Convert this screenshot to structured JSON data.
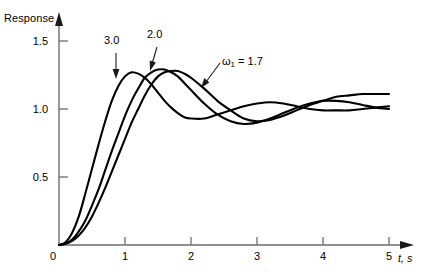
{
  "figure": {
    "background": "#ffffff",
    "ink_color": "#000000",
    "axis_color": "#6d6d6d"
  },
  "axes": {
    "y_title": "Response",
    "x_title": "t, s",
    "origin_label": "0",
    "y_ticks": [
      {
        "value": 0.5,
        "label": "0.5"
      },
      {
        "value": 1.0,
        "label": "1.0"
      },
      {
        "value": 1.5,
        "label": "1.5"
      }
    ],
    "x_ticks": [
      {
        "value": 1,
        "label": "1"
      },
      {
        "value": 2,
        "label": "2"
      },
      {
        "value": 3,
        "label": "3"
      },
      {
        "value": 4,
        "label": "4"
      },
      {
        "value": 5,
        "label": "5"
      }
    ]
  },
  "annotations": {
    "label_3": "3.0",
    "label_2": "2.0",
    "label_w1_prefix": "ω",
    "label_w1_sub": "1",
    "label_w1_value": " = 1.7"
  },
  "chart_data": {
    "type": "line",
    "title": "",
    "xlabel": "t, s",
    "ylabel": "Response",
    "xlim": [
      0,
      5.3
    ],
    "ylim": [
      0,
      1.62
    ],
    "grid": false,
    "legend": "inline-annotations",
    "x": [
      0,
      0.1,
      0.2,
      0.3,
      0.4,
      0.5,
      0.6,
      0.7,
      0.8,
      0.9,
      1.0,
      1.1,
      1.2,
      1.3,
      1.4,
      1.5,
      1.6,
      1.7,
      1.8,
      1.9,
      2.0,
      2.2,
      2.4,
      2.6,
      2.8,
      3.0,
      3.2,
      3.4,
      3.6,
      3.8,
      4.0,
      4.2,
      4.4,
      4.6,
      4.8,
      5.0
    ],
    "series": [
      {
        "name": "ω₁ = 3.0",
        "label": "3.0",
        "omega": 3.0,
        "zeta": 0.32,
        "peak_time": 0.85,
        "peak_value": 1.26,
        "values": [
          0.0,
          0.02,
          0.09,
          0.21,
          0.38,
          0.56,
          0.74,
          0.91,
          1.06,
          1.17,
          1.24,
          1.27,
          1.26,
          1.23,
          1.18,
          1.12,
          1.06,
          1.01,
          0.97,
          0.94,
          0.93,
          0.93,
          0.96,
          0.99,
          1.02,
          1.04,
          1.05,
          1.04,
          1.02,
          1.0,
          0.99,
          0.99,
          0.99,
          1.0,
          1.01,
          1.02
        ]
      },
      {
        "name": "ω₁ = 2.0",
        "label": "2.0",
        "omega": 2.0,
        "zeta": 0.3,
        "peak_time": 1.38,
        "peak_value": 1.29,
        "values": [
          0.0,
          0.01,
          0.04,
          0.1,
          0.18,
          0.29,
          0.41,
          0.55,
          0.69,
          0.82,
          0.95,
          1.06,
          1.15,
          1.23,
          1.27,
          1.29,
          1.29,
          1.27,
          1.24,
          1.19,
          1.14,
          1.04,
          0.96,
          0.91,
          0.89,
          0.9,
          0.93,
          0.97,
          1.01,
          1.04,
          1.06,
          1.06,
          1.05,
          1.03,
          1.01,
          1.0
        ]
      },
      {
        "name": "ω₁ = 1.7",
        "label": "ω₁ = 1.7",
        "omega": 1.7,
        "zeta": 0.28,
        "peak_time": 1.72,
        "peak_value": 1.28,
        "values": [
          0.0,
          0.01,
          0.03,
          0.07,
          0.13,
          0.21,
          0.31,
          0.42,
          0.54,
          0.66,
          0.78,
          0.9,
          1.0,
          1.1,
          1.18,
          1.24,
          1.27,
          1.28,
          1.28,
          1.26,
          1.23,
          1.15,
          1.06,
          0.99,
          0.93,
          0.91,
          0.92,
          0.95,
          0.99,
          1.03,
          1.06,
          1.09,
          1.1,
          1.11,
          1.11,
          1.11
        ]
      }
    ]
  }
}
